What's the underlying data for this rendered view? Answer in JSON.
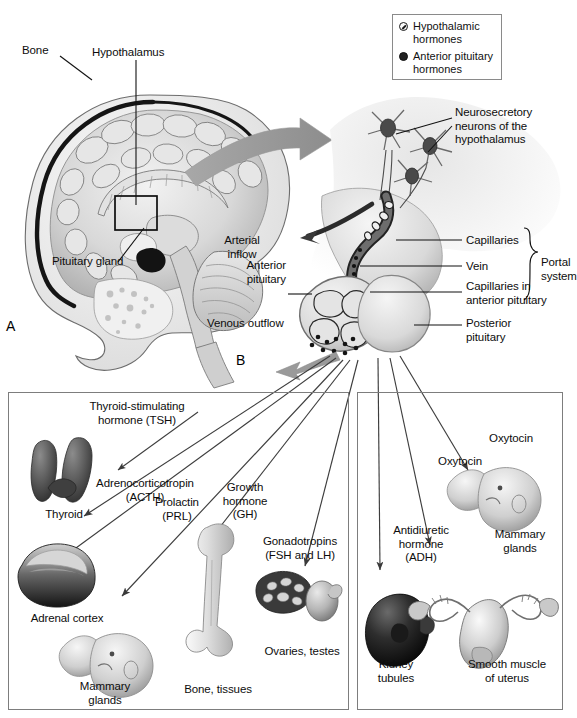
{
  "figure": {
    "panels": [
      {
        "id": "A",
        "letter": "A"
      },
      {
        "id": "B",
        "letter": "B"
      }
    ]
  },
  "legend": {
    "items": [
      {
        "marker": "hypothalamic-hormone-dot",
        "label": "Hypothalamic\nhormones",
        "color": "#ffffff"
      },
      {
        "marker": "anterior-pituitary-hormone-dot",
        "label": "Anterior pituitary\nhormones",
        "color": "#222222"
      }
    ]
  },
  "panel_a": {
    "letter": "A",
    "labels": [
      {
        "name": "bone",
        "text": "Bone"
      },
      {
        "name": "hypothalamus",
        "text": "Hypothalamus"
      },
      {
        "name": "pituitary-gland",
        "text": "Pituitary gland"
      }
    ]
  },
  "panel_b": {
    "letter": "B",
    "labels": [
      {
        "name": "neurosecretory-neurons",
        "text": "Neurosecretory\nneurons of the\nhypothalamus"
      },
      {
        "name": "arterial-inflow",
        "text": "Arterial\ninflow"
      },
      {
        "name": "capillaries",
        "text": "Capillaries"
      },
      {
        "name": "vein",
        "text": "Vein"
      },
      {
        "name": "capillaries-anterior-pituitary",
        "text": "Capillaries in\nanterior pituitary"
      },
      {
        "name": "portal-system",
        "text": "Portal\nsystem"
      },
      {
        "name": "anterior-pituitary",
        "text": "Anterior\npituitary"
      },
      {
        "name": "posterior-pituitary",
        "text": "Posterior\npituitary"
      },
      {
        "name": "venous-outflow",
        "text": "Venous outflow"
      }
    ]
  },
  "anterior_pituitary_panel": {
    "hormones": [
      {
        "name": "tsh",
        "text": "Thyroid-stimulating\nhormone (TSH)"
      },
      {
        "name": "acth",
        "text": "Adrenocorticotropin\n(ACTH)"
      },
      {
        "name": "prl",
        "text": "Prolactin\n(PRL)"
      },
      {
        "name": "gh",
        "text": "Growth\nhormone\n(GH)"
      },
      {
        "name": "gonadotropins",
        "text": "Gonadotropins\n(FSH and LH)"
      }
    ],
    "targets": [
      {
        "name": "thyroid",
        "text": "Thyroid"
      },
      {
        "name": "adrenal-cortex",
        "text": "Adrenal cortex"
      },
      {
        "name": "mammary-glands",
        "text": "Mammary\nglands"
      },
      {
        "name": "bone-tissues",
        "text": "Bone, tissues"
      },
      {
        "name": "ovaries-testes",
        "text": "Ovaries, testes"
      }
    ]
  },
  "posterior_pituitary_panel": {
    "hormones": [
      {
        "name": "oxytocin-mammary",
        "text": "Oxytocin"
      },
      {
        "name": "oxytocin-uterus",
        "text": "Oxytocin"
      },
      {
        "name": "adh",
        "text": "Antidiuretic\nhormone\n(ADH)"
      }
    ],
    "targets": [
      {
        "name": "mammary-glands",
        "text": "Mammary\nglands"
      },
      {
        "name": "kidney-tubules",
        "text": "Kidney\ntubules"
      },
      {
        "name": "smooth-muscle-uterus",
        "text": "Smooth muscle\nof uterus"
      }
    ]
  },
  "colors": {
    "arrow": "#6f6f6f",
    "line": "#1a1a1a",
    "box_border": "#7d7d7d",
    "text": "#111111"
  }
}
